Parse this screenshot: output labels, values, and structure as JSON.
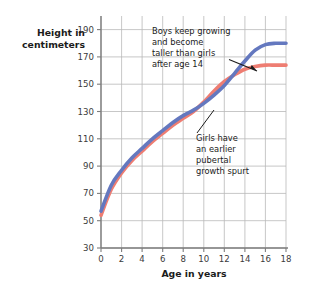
{
  "chart_data": {
    "type": "line",
    "title": "",
    "xlabel": "Age in years",
    "ylabel": "Height in centimeters",
    "ylabel_line1": "Height in",
    "ylabel_line2": "centimeters",
    "xlim": [
      0,
      18
    ],
    "ylim": [
      30,
      200
    ],
    "xticks": [
      0,
      2,
      4,
      6,
      8,
      10,
      12,
      14,
      16,
      18
    ],
    "yticks": [
      30,
      50,
      70,
      90,
      110,
      130,
      150,
      170,
      190
    ],
    "xtick_labels": [
      "0",
      "2",
      "4",
      "6",
      "8",
      "10",
      "12",
      "14",
      "16",
      "18"
    ],
    "ytick_labels": [
      "30",
      "50",
      "70",
      "90",
      "110",
      "130",
      "150",
      "170",
      "190"
    ],
    "grid": true,
    "legend": "none",
    "x": [
      0,
      1,
      2,
      3,
      4,
      5,
      6,
      7,
      8,
      9,
      10,
      11,
      12,
      13,
      14,
      15,
      16,
      17,
      18
    ],
    "series": [
      {
        "name": "Boys",
        "color": "#6478bf",
        "values": [
          57,
          76,
          87,
          96,
          103,
          110,
          116,
          122,
          127,
          131,
          136,
          142,
          149,
          158,
          167,
          175,
          179,
          180,
          180
        ]
      },
      {
        "name": "Girls",
        "color": "#ee7d72",
        "values": [
          54,
          73,
          85,
          94,
          101,
          108,
          114,
          120,
          125,
          130,
          137,
          145,
          152,
          157,
          161,
          163,
          164,
          164,
          164
        ]
      }
    ],
    "annotations": [
      {
        "id": "boys-annotation",
        "lines": [
          "Boys keep growing",
          "and become",
          "taller than girls",
          "after age 14"
        ],
        "text": "Boys keep growing and become taller than girls after age 14",
        "target_x": 15.2,
        "target_y": 176
      },
      {
        "id": "girls-annotation",
        "lines": [
          "Girls have",
          "an earlier",
          "pubertal",
          "growth spurt"
        ],
        "text": "Girls have an earlier pubertal growth spurt",
        "target_x": 11.0,
        "target_y": 145
      }
    ],
    "colors": {
      "boys_line": "#6478bf",
      "girls_line": "#ee7d72",
      "grid": "#b8b8b8",
      "axis": "#8a8a8a",
      "text": "#1b1b1b",
      "background": "#ffffff"
    }
  }
}
